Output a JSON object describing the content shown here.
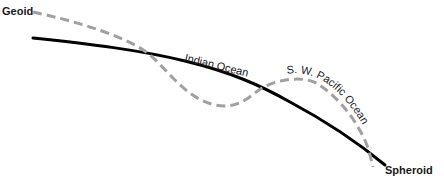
{
  "diagram": {
    "type": "geoid-vs-spheroid",
    "labels": {
      "geoid": "Geoid",
      "spheroid": "Spheroid",
      "indian_ocean": "Indian Ocean",
      "sw_pacific_ocean": "S. W. Pacific Ocean"
    },
    "curves": [
      {
        "name": "Spheroid",
        "style": "solid",
        "color": "#000000"
      },
      {
        "name": "Geoid",
        "style": "dashed",
        "color": "#a0a0a0"
      }
    ],
    "colors": {
      "spheroid_line": "#000000",
      "geoid_line": "#a0a0a0",
      "text": "#222222",
      "background": "#ffffff"
    }
  }
}
